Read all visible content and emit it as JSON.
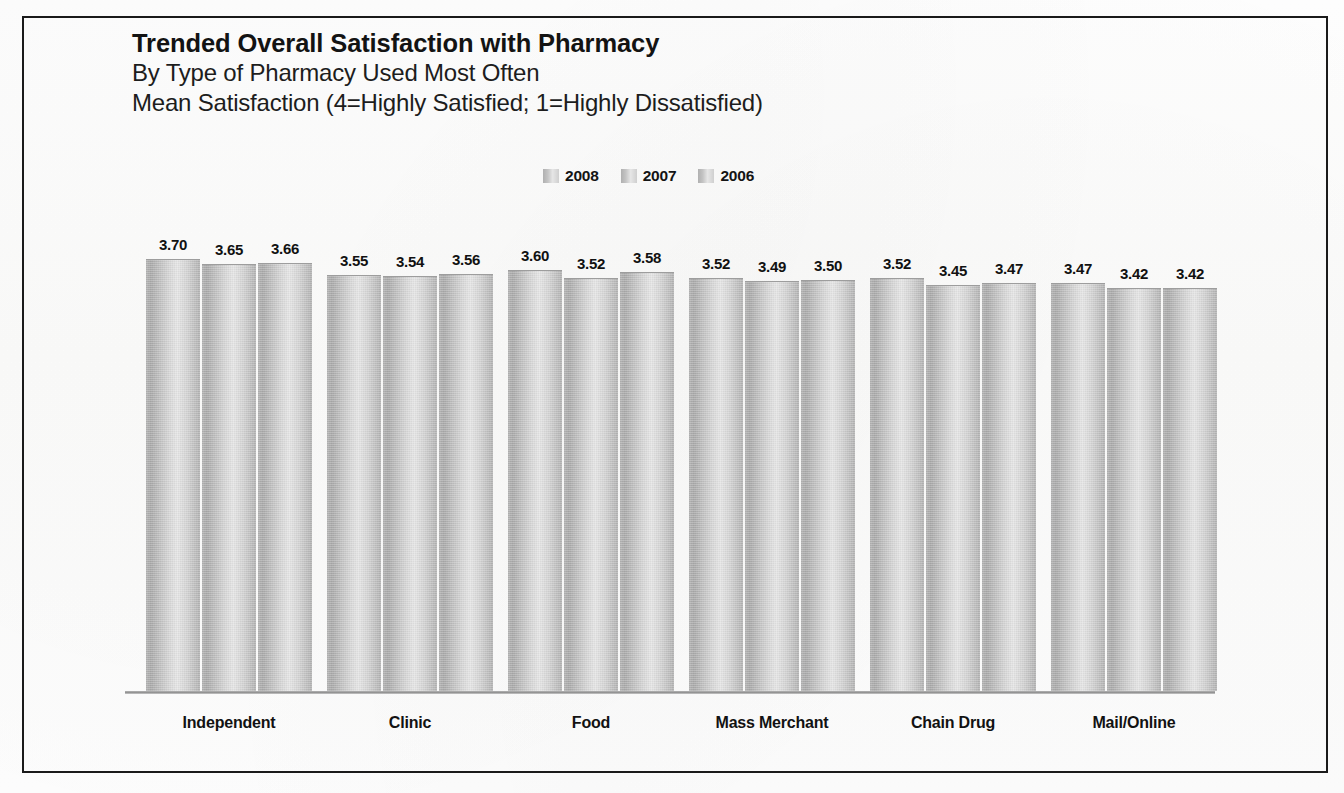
{
  "frame": {
    "border_color": "#1a1a1a"
  },
  "title": {
    "main": "Trended Overall Satisfaction with Pharmacy",
    "sub1": "By Type of Pharmacy Used Most Often",
    "sub2": "Mean Satisfaction (4=Highly Satisfied; 1=Highly Dissatisfied)"
  },
  "legend": {
    "position": "top-center",
    "items": [
      {
        "label": "2008",
        "swatch": "gray-gradient-swatch"
      },
      {
        "label": "2007",
        "swatch": "gray-gradient-swatch"
      },
      {
        "label": "2006",
        "swatch": "gray-gradient-swatch"
      }
    ]
  },
  "chart_data": {
    "type": "bar",
    "title": "Trended Overall Satisfaction with Pharmacy",
    "subtitle": "By Type of Pharmacy Used Most Often",
    "ylabel": "Mean Satisfaction (4=Highly Satisfied; 1=Highly Dissatisfied)",
    "xlabel": "",
    "categories": [
      "Independent",
      "Clinic",
      "Food",
      "Mass Merchant",
      "Chain Drug",
      "Mail/Online"
    ],
    "series": [
      {
        "name": "2008",
        "values": [
          3.7,
          3.55,
          3.6,
          3.52,
          3.52,
          3.47
        ]
      },
      {
        "name": "2007",
        "values": [
          3.65,
          3.54,
          3.52,
          3.49,
          3.45,
          3.42
        ]
      },
      {
        "name": "2006",
        "values": [
          3.66,
          3.56,
          3.58,
          3.5,
          3.47,
          3.42
        ]
      }
    ],
    "value_labels": [
      [
        "3.70",
        "3.65",
        "3.66"
      ],
      [
        "3.55",
        "3.54",
        "3.56"
      ],
      [
        "3.60",
        "3.52",
        "3.58"
      ],
      [
        "3.52",
        "3.49",
        "3.50"
      ],
      [
        "3.52",
        "3.45",
        "3.47"
      ],
      [
        "3.47",
        "3.42",
        "3.42"
      ]
    ],
    "ylim": [
      0,
      4
    ],
    "grid": false,
    "legend_entries": [
      "2008",
      "2007",
      "2006"
    ],
    "bar_color": "#c3c3c3",
    "value_label_color": "#111111"
  }
}
